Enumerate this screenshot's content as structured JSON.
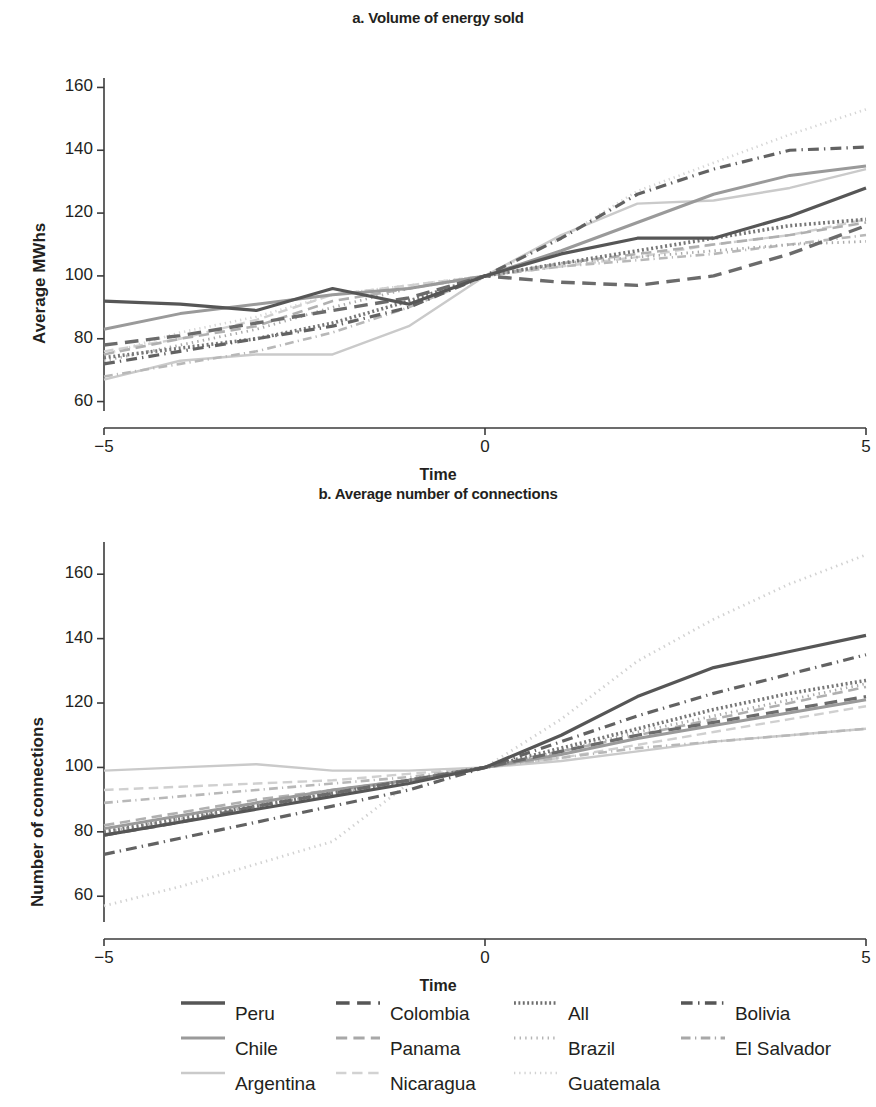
{
  "figure": {
    "legend": {
      "rows": [
        [
          {
            "name": "Peru",
            "style": "solid",
            "color": "#565656"
          },
          {
            "name": "Colombia",
            "style": "dash",
            "color": "#565656"
          },
          {
            "name": "All",
            "style": "hatch",
            "color": "#6e6e6e"
          },
          {
            "name": "Bolivia",
            "style": "dashdot",
            "color": "#565656"
          }
        ],
        [
          {
            "name": "Chile",
            "style": "solid",
            "color": "#9a9a9a"
          },
          {
            "name": "Panama",
            "style": "dash",
            "color": "#a8a8a8"
          },
          {
            "name": "Brazil",
            "style": "dot",
            "color": "#b4b4b4"
          },
          {
            "name": "El Salvador",
            "style": "dashdot",
            "color": "#a8a8a8"
          }
        ],
        [
          {
            "name": "Argentina",
            "style": "solid",
            "color": "#cacaca"
          },
          {
            "name": "Nicaragua",
            "style": "dash",
            "color": "#d2d2d2"
          },
          {
            "name": "Guatemala",
            "style": "dot",
            "color": "#d2d2d2"
          }
        ]
      ]
    }
  },
  "chart_data": [
    {
      "id": "a",
      "type": "line",
      "title": "a. Volume of energy sold",
      "xlabel": "Time",
      "ylabel": "Average MWhs",
      "x": [
        -5,
        -4,
        -3,
        -2,
        -1,
        0,
        1,
        2,
        3,
        4,
        5
      ],
      "xlim": [
        -5,
        5
      ],
      "ylim": [
        57,
        163
      ],
      "xticks": [
        -5,
        0,
        5
      ],
      "xticklabels": [
        "−5",
        "0",
        "5"
      ],
      "yticks": [
        60,
        80,
        100,
        120,
        140,
        160
      ],
      "yticklabels": [
        "60",
        "80",
        "100",
        "120",
        "140",
        "160"
      ],
      "grid": false,
      "legend_position": "below-figure",
      "series": [
        {
          "name": "Peru",
          "style": "solid",
          "color": "#565656",
          "width": 3.2,
          "values": [
            92,
            91,
            89,
            96,
            91,
            100,
            107,
            112,
            112,
            119,
            128
          ]
        },
        {
          "name": "Colombia",
          "style": "dash",
          "color": "#6b6b6b",
          "width": 3.4,
          "values": [
            78,
            81,
            85,
            89,
            93,
            100,
            98,
            97,
            100,
            107,
            116
          ]
        },
        {
          "name": "All",
          "style": "hatch",
          "color": "#777777",
          "width": 3.6,
          "values": [
            74,
            77,
            80,
            85,
            92,
            100,
            104,
            108,
            112,
            116,
            118
          ]
        },
        {
          "name": "Bolivia",
          "style": "dashdot",
          "color": "#626262",
          "width": 3.2,
          "values": [
            72,
            76,
            80,
            84,
            90,
            100,
            112,
            126,
            134,
            140,
            141
          ]
        },
        {
          "name": "Chile",
          "style": "solid",
          "color": "#9a9a9a",
          "width": 3.0,
          "values": [
            83,
            88,
            91,
            94,
            96,
            100,
            108,
            117,
            126,
            132,
            135
          ]
        },
        {
          "name": "Panama",
          "style": "dash",
          "color": "#b0b0b0",
          "width": 2.6,
          "values": [
            75,
            80,
            84,
            92,
            96,
            100,
            104,
            107,
            110,
            113,
            117
          ]
        },
        {
          "name": "Brazil",
          "style": "dot",
          "color": "#aaaaaa",
          "width": 2.8,
          "values": [
            73,
            78,
            83,
            90,
            96,
            100,
            104,
            106,
            108,
            110,
            111
          ]
        },
        {
          "name": "El Salvador",
          "style": "dashdot",
          "color": "#b8b8b8",
          "width": 2.6,
          "values": [
            68,
            72,
            76,
            82,
            90,
            100,
            103,
            105,
            107,
            110,
            113
          ]
        },
        {
          "name": "Argentina",
          "style": "solid",
          "color": "#cacaca",
          "width": 2.4,
          "values": [
            67,
            73,
            75,
            75,
            84,
            100,
            113,
            123,
            124,
            128,
            134
          ]
        },
        {
          "name": "Nicaragua",
          "style": "dash",
          "color": "#d0d0d0",
          "width": 2.4,
          "values": [
            76,
            80,
            86,
            94,
            97,
            100,
            103,
            106,
            110,
            113,
            118
          ]
        },
        {
          "name": "Guatemala",
          "style": "dot",
          "color": "#d6d6d6",
          "width": 2.6,
          "values": [
            75,
            82,
            87,
            94,
            97,
            100,
            112,
            127,
            136,
            145,
            153
          ]
        }
      ]
    },
    {
      "id": "b",
      "type": "line",
      "title": "b. Average number of connections",
      "xlabel": "Time",
      "ylabel": "Number of  connections",
      "x": [
        -5,
        -4,
        -3,
        -2,
        -1,
        0,
        1,
        2,
        3,
        4,
        5
      ],
      "xlim": [
        -5,
        5
      ],
      "ylim": [
        52,
        170
      ],
      "xticks": [
        -5,
        0,
        5
      ],
      "xticklabels": [
        "−5",
        "0",
        "5"
      ],
      "yticks": [
        60,
        80,
        100,
        120,
        140,
        160
      ],
      "yticklabels": [
        "60",
        "80",
        "100",
        "120",
        "140",
        "160"
      ],
      "grid": false,
      "legend_position": "below-figure",
      "series": [
        {
          "name": "Peru",
          "style": "solid",
          "color": "#565656",
          "width": 3.2,
          "values": [
            79,
            83,
            87,
            91,
            95,
            100,
            110,
            122,
            131,
            136,
            141
          ]
        },
        {
          "name": "Colombia",
          "style": "dash",
          "color": "#6b6b6b",
          "width": 3.2,
          "values": [
            79,
            83,
            88,
            92,
            96,
            100,
            105,
            110,
            114,
            118,
            122
          ]
        },
        {
          "name": "All",
          "style": "hatch",
          "color": "#777777",
          "width": 3.6,
          "values": [
            80,
            84,
            88,
            92,
            96,
            100,
            106,
            112,
            118,
            123,
            127
          ]
        },
        {
          "name": "Bolivia",
          "style": "dashdot",
          "color": "#626262",
          "width": 3.2,
          "values": [
            73,
            78,
            83,
            88,
            93,
            100,
            108,
            116,
            123,
            129,
            135
          ]
        },
        {
          "name": "Chile",
          "style": "solid",
          "color": "#9a9a9a",
          "width": 3.0,
          "values": [
            81,
            85,
            89,
            93,
            96,
            100,
            104,
            109,
            113,
            117,
            121
          ]
        },
        {
          "name": "Panama",
          "style": "dash",
          "color": "#b0b0b0",
          "width": 2.6,
          "values": [
            82,
            86,
            90,
            93,
            96,
            100,
            105,
            110,
            115,
            120,
            125
          ]
        },
        {
          "name": "Brazil",
          "style": "dot",
          "color": "#aaaaaa",
          "width": 2.8,
          "values": [
            80,
            84,
            88,
            92,
            96,
            100,
            105,
            111,
            116,
            121,
            126
          ]
        },
        {
          "name": "El Salvador",
          "style": "dashdot",
          "color": "#b8b8b8",
          "width": 2.6,
          "values": [
            89,
            91,
            93,
            95,
            97,
            100,
            103,
            106,
            108,
            110,
            112
          ]
        },
        {
          "name": "Argentina",
          "style": "solid",
          "color": "#cacaca",
          "width": 2.4,
          "values": [
            99,
            100,
            101,
            99,
            99,
            100,
            102,
            105,
            108,
            110,
            112
          ]
        },
        {
          "name": "Nicaragua",
          "style": "dash",
          "color": "#d0d0d0",
          "width": 2.4,
          "values": [
            93,
            94,
            95,
            96,
            98,
            100,
            103,
            107,
            111,
            115,
            119
          ]
        },
        {
          "name": "Guatemala",
          "style": "dot",
          "color": "#d2d2d2",
          "width": 2.8,
          "values": [
            57,
            63,
            70,
            77,
            95,
            100,
            115,
            133,
            146,
            157,
            166
          ]
        }
      ]
    }
  ]
}
